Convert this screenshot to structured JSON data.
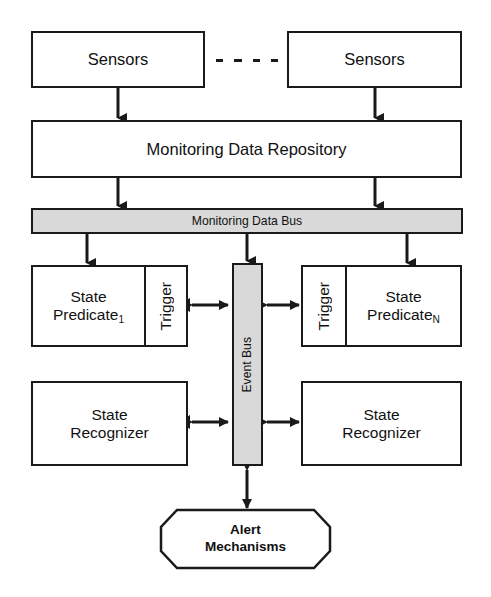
{
  "diagram": {
    "colors": {
      "stroke": "#1a1a1a",
      "bus_fill": "#d9d9d9",
      "node_fill": "#ffffff",
      "text": "#111111"
    },
    "nodes": {
      "sensors_left": {
        "label": "Sensors"
      },
      "sensors_right": {
        "label": "Sensors"
      },
      "ellipsis": {
        "label": "- - - -",
        "dash_count": 4
      },
      "repository": {
        "label": "Monitoring Data Repository"
      },
      "monitoring_data_bus": {
        "label": "Monitoring Data Bus"
      },
      "state_predicate_1": {
        "label": "State\nPredicate",
        "subscript": "1"
      },
      "trigger_left": {
        "label": "Trigger"
      },
      "state_predicate_n": {
        "label": "State\nPredicate",
        "subscript": "N"
      },
      "trigger_right": {
        "label": "Trigger"
      },
      "event_bus": {
        "label": "Event Bus"
      },
      "state_recognizer_left": {
        "label": "State\nRecognizer"
      },
      "state_recognizer_right": {
        "label": "State\nRecognizer"
      },
      "alert_mechanisms": {
        "label": "Alert\nMechanisms"
      }
    },
    "connectors": [
      {
        "name": "sensors-left-to-repository",
        "type": "arrow-down"
      },
      {
        "name": "sensors-right-to-repository",
        "type": "arrow-down"
      },
      {
        "name": "repository-to-monitoring-data-bus-left",
        "type": "arrow-down"
      },
      {
        "name": "repository-to-monitoring-data-bus-right",
        "type": "arrow-down"
      },
      {
        "name": "monitoring-data-bus-to-state-predicate-1",
        "type": "arrow-down"
      },
      {
        "name": "monitoring-data-bus-to-event-bus",
        "type": "arrow-down"
      },
      {
        "name": "monitoring-data-bus-to-state-predicate-n",
        "type": "arrow-down"
      },
      {
        "name": "trigger-left-to-event-bus",
        "type": "arrow-bidirectional"
      },
      {
        "name": "event-bus-to-trigger-right",
        "type": "arrow-bidirectional"
      },
      {
        "name": "state-recognizer-left-to-event-bus",
        "type": "arrow-bidirectional"
      },
      {
        "name": "event-bus-to-state-recognizer-right",
        "type": "arrow-bidirectional"
      },
      {
        "name": "event-bus-to-alert-mechanisms",
        "type": "arrow-bidirectional-vertical"
      }
    ]
  }
}
